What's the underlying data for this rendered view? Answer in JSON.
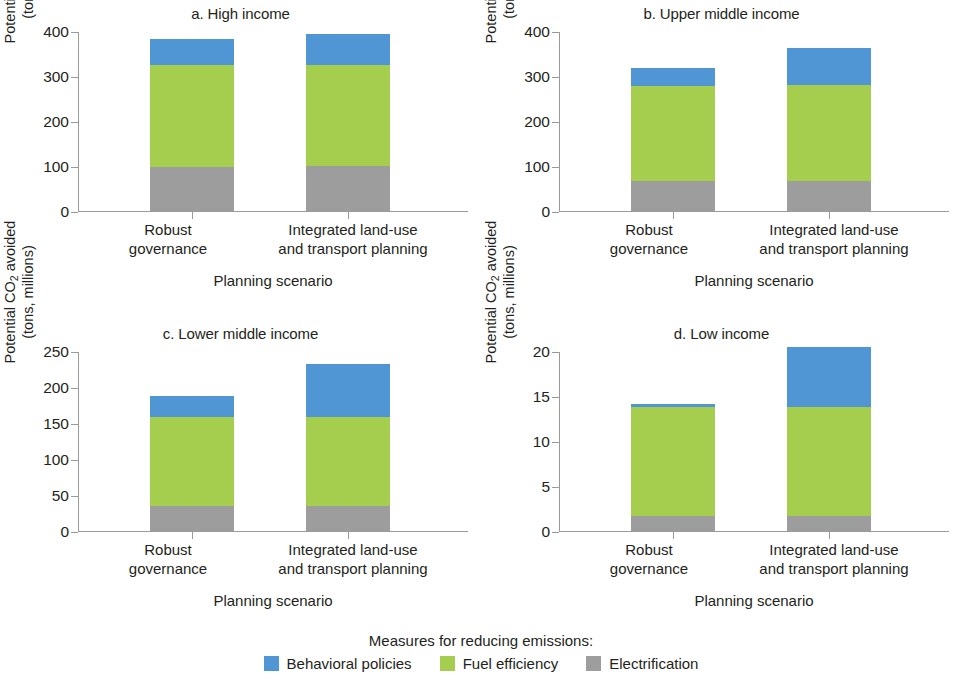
{
  "figure": {
    "legend_title": "Measures for reducing emissions:",
    "series": [
      {
        "name": "Behavioral policies",
        "key": "behavioral",
        "color": "#5096d4"
      },
      {
        "name": "Fuel efficiency",
        "key": "fuel",
        "color": "#a6ce4e"
      },
      {
        "name": "Electrification",
        "key": "electrification",
        "color": "#9d9d9d"
      }
    ],
    "ylabel_line1": "Potential CO",
    "ylabel_sub": "2",
    "ylabel_line1b": " avoided",
    "ylabel_line2": "(tons, millions)",
    "xlabel": "Planning scenario",
    "categories": [
      "Robust governance",
      "Integrated land-use and transport planning"
    ],
    "category_lines": [
      [
        "Robust",
        "governance"
      ],
      [
        "Integrated land-use",
        "and transport planning"
      ]
    ]
  },
  "chart_data": [
    {
      "type": "bar",
      "id": "a",
      "title": "a. High income",
      "stacked": true,
      "categories": [
        "Robust governance",
        "Integrated land-use and transport planning"
      ],
      "series": [
        {
          "name": "Electrification",
          "values": [
            97,
            99
          ]
        },
        {
          "name": "Fuel efficiency",
          "values": [
            228,
            226
          ]
        },
        {
          "name": "Behavioral policies",
          "values": [
            58,
            68
          ]
        }
      ],
      "totals": [
        383,
        393
      ],
      "xlabel": "Planning scenario",
      "ylabel": "Potential CO2 avoided (tons, millions)",
      "ylim": [
        0,
        400
      ],
      "yticks": [
        0,
        100,
        200,
        300,
        400
      ],
      "grid": false,
      "legend_position": "bottom"
    },
    {
      "type": "bar",
      "id": "b",
      "title": "b. Upper middle income",
      "stacked": true,
      "categories": [
        "Robust governance",
        "Integrated land-use and transport planning"
      ],
      "series": [
        {
          "name": "Electrification",
          "values": [
            66,
            67
          ]
        },
        {
          "name": "Fuel efficiency",
          "values": [
            212,
            212
          ]
        },
        {
          "name": "Behavioral policies",
          "values": [
            40,
            84
          ]
        }
      ],
      "totals": [
        318,
        363
      ],
      "xlabel": "Planning scenario",
      "ylabel": "Potential CO2 avoided (tons, millions)",
      "ylim": [
        0,
        400
      ],
      "yticks": [
        0,
        100,
        200,
        300,
        400
      ],
      "grid": false,
      "legend_position": "bottom"
    },
    {
      "type": "bar",
      "id": "c",
      "title": "c. Lower middle income",
      "stacked": true,
      "categories": [
        "Robust governance",
        "Integrated land-use and transport planning"
      ],
      "series": [
        {
          "name": "Electrification",
          "values": [
            35,
            35
          ]
        },
        {
          "name": "Fuel efficiency",
          "values": [
            123,
            123
          ]
        },
        {
          "name": "Behavioral policies",
          "values": [
            30,
            74
          ]
        }
      ],
      "totals": [
        188,
        232
      ],
      "xlabel": "Planning scenario",
      "ylabel": "Potential CO2 avoided (tons, millions)",
      "ylim": [
        0,
        250
      ],
      "yticks": [
        0,
        50,
        100,
        150,
        200,
        250
      ],
      "grid": false,
      "legend_position": "bottom"
    },
    {
      "type": "bar",
      "id": "d",
      "title": "d. Low income",
      "stacked": true,
      "categories": [
        "Robust governance",
        "Integrated land-use and transport planning"
      ],
      "series": [
        {
          "name": "Electrification",
          "values": [
            1.7,
            1.7
          ]
        },
        {
          "name": "Fuel efficiency",
          "values": [
            12.1,
            12.1
          ]
        },
        {
          "name": "Behavioral policies",
          "values": [
            0.3,
            6.7
          ]
        }
      ],
      "totals": [
        14.1,
        20.5
      ],
      "xlabel": "Planning scenario",
      "ylabel": "Potential CO2 avoided (tons, millions)",
      "ylim": [
        0,
        20
      ],
      "yticks": [
        0,
        5,
        10,
        15,
        20
      ],
      "grid": false,
      "legend_position": "bottom"
    }
  ]
}
